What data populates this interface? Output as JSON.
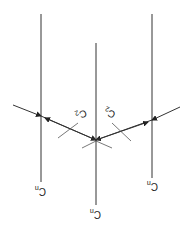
{
  "diagram": {
    "labels": {
      "cn_axis_left": "C",
      "cn_axis_left_sub": "n",
      "cn_axis_center": "C",
      "cn_axis_center_sub": "n",
      "cn_axis_right": "C",
      "cn_axis_right_sub": "n",
      "c2_axis_left": "C",
      "c2_axis_left_sub": "2",
      "c2_axis_right": "C",
      "c2_axis_right_sub": "2"
    },
    "colors": {
      "line": "#333333",
      "background": "#ffffff"
    }
  }
}
